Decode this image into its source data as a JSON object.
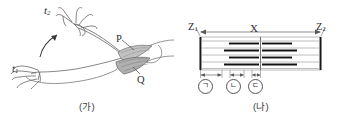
{
  "figure": {
    "panels": [
      {
        "id": "panel-a",
        "caption": "(가)",
        "description": "arm-flexion-diagram",
        "labels": {
          "time_earlier": "t",
          "time_earlier_sub": "1",
          "time_later": "t",
          "time_later_sub": "2",
          "muscle_p": "P",
          "muscle_q": "Q"
        }
      },
      {
        "id": "panel-b",
        "caption": "(나)",
        "description": "sarcomere-diagram",
        "labels": {
          "z_line_left": "Z",
          "z_line_left_sub": "1",
          "z_line_right": "Z",
          "z_line_right_sub": "2",
          "sarcomere_span": "X",
          "segment_1": "ㄱ",
          "segment_2": "ㄴ",
          "segment_3": "ㄷ"
        }
      }
    ]
  },
  "colors": {
    "background": "#ffffff",
    "ink": "#2e2e2e",
    "line_light": "#9a9a9a",
    "filament_thick": "#1a1a1a",
    "filament_thin": "#7d7d7d",
    "z_line": "#1a1a1a",
    "dimension": "#4a4a4a",
    "muscle_shade": "#b9b9b9"
  }
}
